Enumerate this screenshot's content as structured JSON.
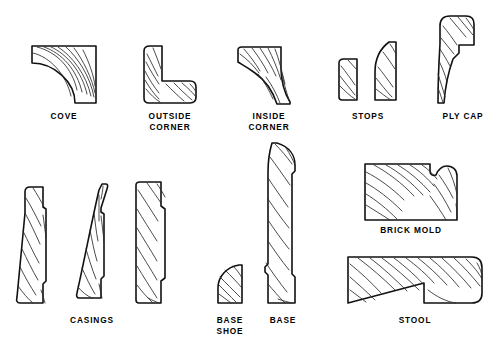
{
  "figure": {
    "background_color": "#ffffff",
    "line_color": "#111111",
    "grain_color": "#2a2a2a",
    "text_color": "#000000",
    "width": 498,
    "height": 350
  },
  "labels": {
    "cove": "COVE",
    "outside_corner_line1": "OUTSIDE",
    "outside_corner_line2": "CORNER",
    "inside_corner_line1": "INSIDE",
    "inside_corner_line2": "CORNER",
    "stops": "STOPS",
    "ply_cap": "PLY  CAP",
    "casings": "CASINGS",
    "base_shoe_line1": "BASE",
    "base_shoe_line2": "SHOE",
    "base": "BASE",
    "brick_mold": "BRICK  MOLD",
    "stool": "STOOL"
  },
  "profiles": [
    {
      "id": "cove",
      "label": "COVE",
      "row": "top",
      "column": 1,
      "shape": "quarter-round concave cove molding"
    },
    {
      "id": "outside-corner",
      "label": "OUTSIDE CORNER",
      "row": "top",
      "column": 2,
      "shape": "L-shaped outside corner molding"
    },
    {
      "id": "inside-corner",
      "label": "INSIDE CORNER",
      "row": "top",
      "column": 3,
      "shape": "concave ogee inside corner molding"
    },
    {
      "id": "stop-small",
      "label": "STOPS",
      "row": "top",
      "column": 4,
      "shape": "small rectangular door stop"
    },
    {
      "id": "stop-large",
      "label": "STOPS",
      "row": "top",
      "column": 4,
      "shape": "tall curved-top door stop"
    },
    {
      "id": "ply-cap",
      "label": "PLY CAP",
      "row": "top",
      "column": 5,
      "shape": "rounded cap with rabbet notch"
    },
    {
      "id": "casing-1",
      "label": "CASINGS",
      "row": "bottom",
      "column": 1,
      "shape": "tapered casing with back relief"
    },
    {
      "id": "casing-2",
      "label": "CASINGS",
      "row": "bottom",
      "column": 1,
      "shape": "curved tapered casing"
    },
    {
      "id": "casing-3",
      "label": "CASINGS",
      "row": "bottom",
      "column": 1,
      "shape": "flat casing with stepped edge"
    },
    {
      "id": "base-shoe",
      "label": "BASE SHOE",
      "row": "bottom",
      "column": 2,
      "shape": "small quarter-round base shoe"
    },
    {
      "id": "base",
      "label": "BASE",
      "row": "bottom",
      "column": 3,
      "shape": "tall baseboard with rounded top"
    },
    {
      "id": "brick-mold",
      "label": "BRICK MOLD",
      "row": "bottom",
      "column": 4,
      "shape": "wide brick mold with bead notch"
    },
    {
      "id": "stool",
      "label": "STOOL",
      "row": "bottom",
      "column": 4,
      "shape": "window stool with rabbeted underside"
    }
  ]
}
